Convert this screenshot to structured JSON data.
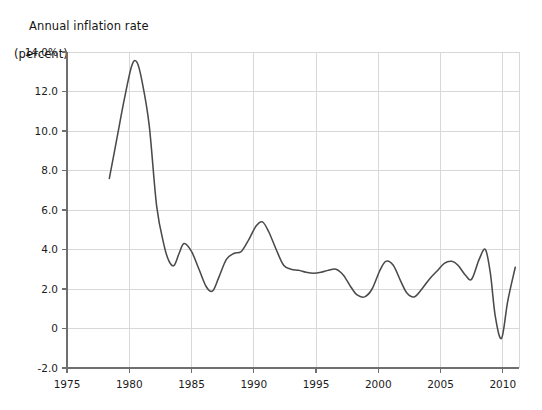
{
  "chart_data": {
    "type": "line",
    "title": "Annual inflation rate\n(percent)",
    "title_line1": "Annual inflation rate",
    "title_line2": "(percent)",
    "xlabel": "",
    "ylabel": "",
    "grid": true,
    "legend": "none",
    "line_color": "#4a4a4a",
    "grid_color": "#d8d8d8",
    "axis_color": "#6f6f6f",
    "background": "#ffffff",
    "xlim": [
      1975,
      2011.3
    ],
    "ylim": [
      -2.0,
      14.0
    ],
    "xticks": [
      1975,
      1980,
      1985,
      1990,
      1995,
      2000,
      2005,
      2010
    ],
    "xtick_labels": [
      "1975",
      "1980",
      "1985",
      "1990",
      "1995",
      "2000",
      "2005",
      "2010"
    ],
    "yticks": [
      -2.0,
      0,
      2.0,
      4.0,
      6.0,
      8.0,
      10.0,
      12.0,
      14.0
    ],
    "ytick_labels": [
      "-2.0",
      "0",
      "2.0",
      "4.0",
      "6.0",
      "8.0",
      "10.0",
      "12.0",
      "14.0%"
    ],
    "series": [
      {
        "name": "Annual inflation rate",
        "x": [
          1978.4,
          1979.0,
          1979.6,
          1980.2,
          1980.6,
          1981.0,
          1981.6,
          1982.2,
          1982.8,
          1983.2,
          1983.6,
          1984.0,
          1984.4,
          1985.0,
          1985.6,
          1986.2,
          1986.7,
          1987.2,
          1987.8,
          1988.4,
          1989.0,
          1989.6,
          1990.2,
          1990.7,
          1991.2,
          1991.8,
          1992.4,
          1993.0,
          1993.6,
          1994.2,
          1994.8,
          1995.4,
          1996.0,
          1996.6,
          1997.2,
          1997.8,
          1998.3,
          1998.9,
          1999.5,
          2000.1,
          2000.6,
          2001.2,
          2001.8,
          2002.3,
          2002.9,
          2003.5,
          2004.1,
          2004.7,
          2005.3,
          2005.9,
          2006.4,
          2007.0,
          2007.5,
          2008.1,
          2008.6,
          2009.0,
          2009.4,
          2009.9,
          2010.4,
          2011.0
        ],
        "y": [
          7.6,
          9.6,
          11.6,
          13.3,
          13.5,
          12.6,
          10.3,
          6.2,
          4.2,
          3.4,
          3.2,
          3.8,
          4.3,
          3.9,
          3.0,
          2.1,
          1.9,
          2.6,
          3.5,
          3.8,
          3.9,
          4.5,
          5.2,
          5.4,
          4.9,
          4.0,
          3.2,
          3.0,
          2.95,
          2.85,
          2.8,
          2.85,
          2.95,
          3.0,
          2.7,
          2.1,
          1.7,
          1.6,
          2.0,
          2.9,
          3.4,
          3.2,
          2.4,
          1.8,
          1.6,
          2.0,
          2.5,
          2.9,
          3.3,
          3.4,
          3.2,
          2.7,
          2.5,
          3.5,
          4.0,
          2.8,
          0.6,
          -0.5,
          1.4,
          3.1
        ]
      }
    ],
    "annotations": {
      "peak_1980": 13.5,
      "trough_2009": -0.5,
      "start_value": 7.6,
      "end_value": 3.1
    }
  }
}
